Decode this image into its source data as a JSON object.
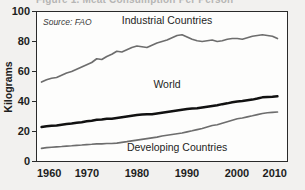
{
  "figure": {
    "cut_title": "Figure 1. Meat Consumption Per Person",
    "source_note": "Source: FAO",
    "background_color": "#f2f1ef",
    "plot_background_color": "#fdfdfc"
  },
  "chart_data": {
    "type": "line",
    "title": "",
    "xlabel": "",
    "ylabel": "Kilograms",
    "xlim": [
      1960,
      2010
    ],
    "ylim": [
      0,
      100
    ],
    "xticks": [
      "1960",
      "1970",
      "1980",
      "1990",
      "2000",
      "2010"
    ],
    "yticks": [
      "0",
      "20",
      "40",
      "60",
      "80",
      "100"
    ],
    "grid": false,
    "legend_position": "inline-annotations",
    "annotations": [
      "Source: FAO"
    ],
    "series": [
      {
        "name": "Industrial Countries",
        "color": "#6d6d6d",
        "label_x": 1986,
        "label_y": 92,
        "x": [
          1961,
          1962,
          1963,
          1964,
          1965,
          1966,
          1967,
          1968,
          1969,
          1970,
          1971,
          1972,
          1973,
          1974,
          1975,
          1976,
          1977,
          1978,
          1979,
          1980,
          1981,
          1982,
          1983,
          1984,
          1985,
          1986,
          1987,
          1988,
          1989,
          1990,
          1991,
          1992,
          1993,
          1994,
          1995,
          1996,
          1997,
          1998,
          1999,
          2000,
          2001,
          2002,
          2003,
          2004,
          2005,
          2006,
          2007,
          2008
        ],
        "values": [
          53.0,
          54.5,
          55.5,
          56.0,
          57.5,
          59.0,
          60.0,
          61.5,
          63.0,
          64.5,
          66.0,
          68.5,
          68.0,
          70.0,
          71.5,
          73.5,
          73.0,
          74.5,
          76.0,
          77.0,
          76.5,
          76.0,
          77.5,
          79.0,
          80.0,
          81.0,
          82.5,
          84.0,
          84.5,
          83.0,
          81.5,
          80.5,
          80.0,
          80.5,
          81.0,
          80.0,
          80.5,
          81.5,
          82.0,
          82.0,
          81.5,
          82.5,
          83.5,
          84.0,
          84.5,
          84.0,
          83.5,
          82.0
        ]
      },
      {
        "name": "World",
        "color": "#111111",
        "label_x": 1986,
        "label_y": 49,
        "x": [
          1961,
          1962,
          1963,
          1964,
          1965,
          1966,
          1967,
          1968,
          1969,
          1970,
          1971,
          1972,
          1973,
          1974,
          1975,
          1976,
          1977,
          1978,
          1979,
          1980,
          1981,
          1982,
          1983,
          1984,
          1985,
          1986,
          1987,
          1988,
          1989,
          1990,
          1991,
          1992,
          1993,
          1994,
          1995,
          1996,
          1997,
          1998,
          1999,
          2000,
          2001,
          2002,
          2003,
          2004,
          2005,
          2006,
          2007,
          2008
        ],
        "values": [
          23.0,
          23.5,
          23.8,
          24.0,
          24.5,
          25.0,
          25.3,
          25.8,
          26.2,
          26.8,
          27.2,
          27.8,
          28.0,
          28.5,
          28.5,
          29.0,
          29.5,
          30.0,
          30.5,
          31.0,
          31.3,
          31.5,
          31.5,
          32.0,
          32.5,
          33.0,
          33.5,
          34.0,
          34.5,
          35.0,
          35.3,
          35.5,
          36.0,
          36.5,
          37.0,
          37.5,
          38.2,
          38.8,
          39.5,
          40.0,
          40.3,
          40.8,
          41.3,
          42.0,
          42.8,
          43.0,
          43.2,
          43.5
        ]
      },
      {
        "name": "Developing Countries",
        "color": "#6d6d6d",
        "label_x": 1988,
        "label_y": 7,
        "x": [
          1961,
          1962,
          1963,
          1964,
          1965,
          1966,
          1967,
          1968,
          1969,
          1970,
          1971,
          1972,
          1973,
          1974,
          1975,
          1976,
          1977,
          1978,
          1979,
          1980,
          1981,
          1982,
          1983,
          1984,
          1985,
          1986,
          1987,
          1988,
          1989,
          1990,
          1991,
          1992,
          1993,
          1994,
          1995,
          1996,
          1997,
          1998,
          1999,
          2000,
          2001,
          2002,
          2003,
          2004,
          2005,
          2006,
          2007,
          2008
        ],
        "values": [
          8.8,
          9.2,
          9.5,
          9.8,
          10.0,
          10.3,
          10.5,
          10.8,
          11.0,
          11.3,
          11.5,
          11.8,
          11.8,
          12.0,
          12.0,
          12.3,
          12.8,
          13.2,
          13.8,
          14.3,
          14.8,
          15.3,
          15.8,
          16.3,
          17.0,
          17.5,
          18.0,
          18.5,
          19.0,
          19.8,
          20.5,
          21.3,
          22.0,
          23.0,
          24.0,
          24.5,
          25.5,
          26.5,
          27.5,
          28.5,
          29.0,
          29.8,
          30.5,
          31.3,
          32.0,
          32.5,
          32.8,
          33.0
        ]
      }
    ]
  }
}
